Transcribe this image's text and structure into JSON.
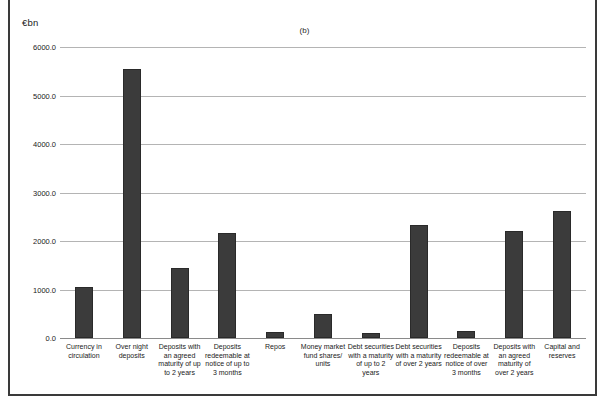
{
  "figure": {
    "panel_title": "(b)",
    "unit_label": "€bn"
  },
  "chart_data": {
    "type": "bar",
    "title": "(b)",
    "xlabel": "",
    "ylabel": "€bn",
    "ylim": [
      0.0,
      6000.0
    ],
    "yticks": [
      "0.0",
      "1000.0",
      "2000.0",
      "3000.0",
      "4000.0",
      "5000.0",
      "6000.0"
    ],
    "ytick_values": [
      0,
      1000,
      2000,
      3000,
      4000,
      5000,
      6000
    ],
    "grid": true,
    "legend": "none",
    "bar_color": "#3b3b3b",
    "categories": [
      "Currency in circulation",
      "Over night deposits",
      "Deposits with an agreed maturity of up to 2 years",
      "Deposits redeemable at notice of up to 3 months",
      "Repos",
      "Money market fund shares/ units",
      "Debt securities with a maturity of up to 2 years",
      "Debt securities with a maturity of over 2 years",
      "Deposits redeemable at notice of over 3 months",
      "Deposits with an agreed maturity of over 2 years",
      "Capital and reserves"
    ],
    "values": [
      1050,
      5540,
      1440,
      2170,
      120,
      490,
      100,
      2320,
      140,
      2210,
      2620
    ]
  }
}
